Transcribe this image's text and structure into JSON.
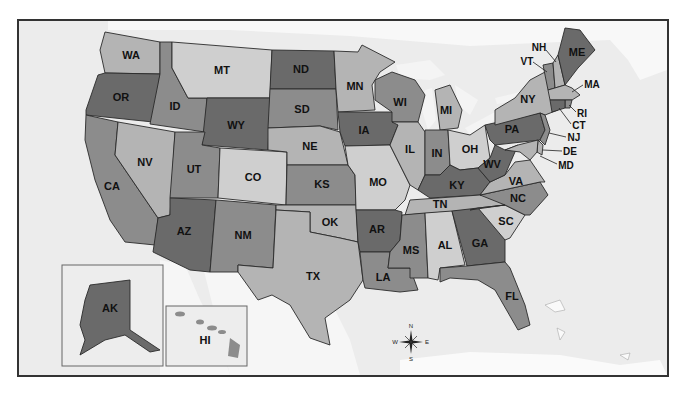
{
  "map": {
    "title": "United States",
    "colors": {
      "dark": "#6a6a6a",
      "medium": "#8c8c8c",
      "light": "#b4b4b4",
      "pale": "#cfcfcf",
      "water": "#ececec",
      "land_foreign": "#f8f8f8",
      "border": "#2a2a2a"
    },
    "states": [
      {
        "abbr": "WA"
      },
      {
        "abbr": "OR"
      },
      {
        "abbr": "CA"
      },
      {
        "abbr": "ID"
      },
      {
        "abbr": "NV"
      },
      {
        "abbr": "MT"
      },
      {
        "abbr": "WY"
      },
      {
        "abbr": "UT"
      },
      {
        "abbr": "AZ"
      },
      {
        "abbr": "CO"
      },
      {
        "abbr": "NM"
      },
      {
        "abbr": "ND"
      },
      {
        "abbr": "SD"
      },
      {
        "abbr": "NE"
      },
      {
        "abbr": "KS"
      },
      {
        "abbr": "OK"
      },
      {
        "abbr": "TX"
      },
      {
        "abbr": "MN"
      },
      {
        "abbr": "IA"
      },
      {
        "abbr": "MO"
      },
      {
        "abbr": "AR"
      },
      {
        "abbr": "LA"
      },
      {
        "abbr": "WI"
      },
      {
        "abbr": "IL"
      },
      {
        "abbr": "MI"
      },
      {
        "abbr": "IN"
      },
      {
        "abbr": "OH"
      },
      {
        "abbr": "KY"
      },
      {
        "abbr": "TN"
      },
      {
        "abbr": "MS"
      },
      {
        "abbr": "AL"
      },
      {
        "abbr": "GA"
      },
      {
        "abbr": "FL"
      },
      {
        "abbr": "SC"
      },
      {
        "abbr": "NC"
      },
      {
        "abbr": "VA"
      },
      {
        "abbr": "WV"
      },
      {
        "abbr": "PA"
      },
      {
        "abbr": "NY"
      },
      {
        "abbr": "VT"
      },
      {
        "abbr": "NH"
      },
      {
        "abbr": "ME"
      },
      {
        "abbr": "MA"
      },
      {
        "abbr": "RI"
      },
      {
        "abbr": "CT"
      },
      {
        "abbr": "NJ"
      },
      {
        "abbr": "DE"
      },
      {
        "abbr": "MD"
      },
      {
        "abbr": "AK"
      },
      {
        "abbr": "HI"
      }
    ],
    "compass": {
      "n": "N",
      "s": "S",
      "e": "E",
      "w": "W"
    }
  }
}
